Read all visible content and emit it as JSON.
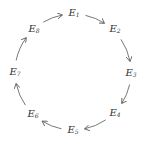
{
  "diagram": {
    "type": "cycle",
    "direction": "clockwise",
    "center": [
      73,
      72
    ],
    "radius": 58,
    "stroke_color": "#555555",
    "text_color": "#333333",
    "nodes": [
      {
        "id": "E1",
        "base": "E",
        "sub": "1",
        "x": 74,
        "y": 13
      },
      {
        "id": "E2",
        "base": "E",
        "sub": "2",
        "x": 115,
        "y": 29
      },
      {
        "id": "E3",
        "base": "E",
        "sub": "3",
        "x": 131,
        "y": 73
      },
      {
        "id": "E4",
        "base": "E",
        "sub": "4",
        "x": 115,
        "y": 113
      },
      {
        "id": "E5",
        "base": "E",
        "sub": "5",
        "x": 73,
        "y": 130
      },
      {
        "id": "E6",
        "base": "E",
        "sub": "6",
        "x": 33,
        "y": 114
      },
      {
        "id": "E7",
        "base": "E",
        "sub": "7",
        "x": 15,
        "y": 72
      },
      {
        "id": "E8",
        "base": "E",
        "sub": "8",
        "x": 34,
        "y": 29
      }
    ],
    "edges": [
      {
        "from": "E1",
        "to": "E2"
      },
      {
        "from": "E2",
        "to": "E3"
      },
      {
        "from": "E3",
        "to": "E4"
      },
      {
        "from": "E4",
        "to": "E5"
      },
      {
        "from": "E5",
        "to": "E6"
      },
      {
        "from": "E6",
        "to": "E7"
      },
      {
        "from": "E7",
        "to": "E8"
      },
      {
        "from": "E8",
        "to": "E1"
      }
    ]
  }
}
